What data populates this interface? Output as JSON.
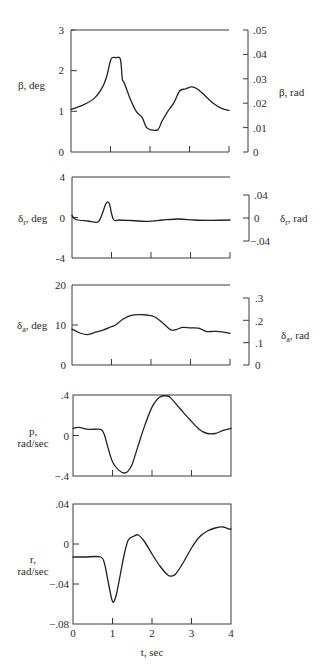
{
  "chart_data": [
    {
      "type": "line",
      "id": "beta",
      "ylabel": "β, deg",
      "ylabel_right": "β, rad",
      "xlim": [
        0,
        4
      ],
      "ylim": [
        0,
        3
      ],
      "yticks": [
        0,
        1,
        2,
        3
      ],
      "ytick_labels": [
        "0",
        "1",
        "2",
        "3"
      ],
      "right_ylim": [
        0,
        0.05
      ],
      "right_yticks": [
        0,
        0.01,
        0.02,
        0.03,
        0.04,
        0.05
      ],
      "right_ytick_labels": [
        "0",
        ".01",
        ".02",
        ".03",
        ".04",
        ".05"
      ],
      "xticks": [
        1,
        2,
        3,
        4
      ],
      "grid": false,
      "x": [
        0,
        0.3,
        0.6,
        0.8,
        0.9,
        1.0,
        1.05,
        1.15,
        1.25,
        1.3,
        1.35,
        1.5,
        1.65,
        1.8,
        1.9,
        2.0,
        2.2,
        2.3,
        2.45,
        2.6,
        2.75,
        2.9,
        3.05,
        3.2,
        3.4,
        3.6,
        3.8,
        4.0
      ],
      "values": [
        1.05,
        1.15,
        1.33,
        1.6,
        1.85,
        2.25,
        2.32,
        2.32,
        2.28,
        1.8,
        1.7,
        1.3,
        1.0,
        0.85,
        0.62,
        0.55,
        0.55,
        0.75,
        1.0,
        1.2,
        1.5,
        1.55,
        1.6,
        1.55,
        1.38,
        1.2,
        1.08,
        1.02
      ]
    },
    {
      "type": "line",
      "id": "delta_r",
      "ylabel": "δr, deg",
      "ylabel_right": "δr, rad",
      "xlim": [
        0,
        4
      ],
      "ylim": [
        -4,
        4
      ],
      "yticks": [
        -4,
        0,
        4
      ],
      "ytick_labels": [
        "-4",
        "0",
        "4"
      ],
      "right_ylim": [
        -0.04,
        0.04
      ],
      "right_yticks": [
        -0.04,
        0,
        0.04
      ],
      "right_ytick_labels": [
        "-.04",
        "0",
        ".04"
      ],
      "xticks": [
        1,
        2,
        3,
        4
      ],
      "grid": false,
      "x": [
        0,
        0.1,
        0.4,
        0.65,
        0.75,
        0.85,
        0.9,
        0.95,
        1.05,
        1.2,
        1.5,
        1.9,
        2.3,
        2.7,
        3.1,
        3.5,
        4.0
      ],
      "values": [
        0.2,
        -0.2,
        -0.35,
        -0.45,
        0.2,
        1.3,
        1.55,
        1.3,
        -0.2,
        -0.25,
        -0.3,
        -0.38,
        -0.25,
        -0.15,
        -0.25,
        -0.28,
        -0.25
      ]
    },
    {
      "type": "line",
      "id": "delta_a",
      "ylabel": "δa, deg",
      "ylabel_right": "δa, rad",
      "xlim": [
        0,
        4
      ],
      "ylim": [
        0,
        20
      ],
      "yticks": [
        0,
        10,
        20
      ],
      "ytick_labels": [
        "0",
        "10",
        "20"
      ],
      "right_ylim": [
        0,
        0.3
      ],
      "right_yticks": [
        0,
        0.1,
        0.2,
        0.3
      ],
      "right_ytick_labels": [
        "0",
        ".1",
        ".2",
        ".3"
      ],
      "xticks": [
        1,
        2,
        3,
        4
      ],
      "grid": false,
      "x": [
        0,
        0.2,
        0.4,
        0.6,
        0.8,
        1.0,
        1.1,
        1.3,
        1.5,
        1.7,
        1.9,
        2.1,
        2.3,
        2.5,
        2.65,
        2.8,
        3.0,
        3.2,
        3.4,
        3.6,
        3.8,
        4.0
      ],
      "values": [
        9.0,
        8.0,
        7.6,
        8.2,
        8.8,
        9.6,
        10.0,
        11.5,
        12.4,
        12.6,
        12.5,
        12.0,
        10.5,
        8.8,
        8.9,
        9.4,
        9.3,
        9.2,
        8.4,
        8.4,
        8.3,
        7.9
      ]
    },
    {
      "type": "line",
      "id": "p",
      "ylabel": "p, rad/sec",
      "xlim": [
        0,
        4
      ],
      "ylim": [
        -0.4,
        0.4
      ],
      "yticks": [
        -0.4,
        0,
        0.4
      ],
      "ytick_labels": [
        "-.4",
        "0",
        ".4"
      ],
      "xticks": [
        1,
        2,
        3,
        4
      ],
      "grid": false,
      "x": [
        0,
        0.15,
        0.4,
        0.7,
        0.8,
        0.9,
        1.0,
        1.15,
        1.3,
        1.4,
        1.5,
        1.65,
        1.8,
        2.0,
        2.2,
        2.4,
        2.5,
        2.7,
        2.95,
        3.2,
        3.4,
        3.6,
        3.8,
        4.0
      ],
      "values": [
        0.07,
        0.08,
        0.06,
        0.06,
        0.0,
        -0.14,
        -0.26,
        -0.34,
        -0.37,
        -0.35,
        -0.28,
        -0.1,
        0.08,
        0.28,
        0.38,
        0.39,
        0.36,
        0.27,
        0.16,
        0.06,
        0.02,
        0.02,
        0.05,
        0.07
      ]
    },
    {
      "type": "line",
      "id": "r",
      "ylabel": "r, rad/sec",
      "xlabel": "t, sec",
      "xlim": [
        0,
        4
      ],
      "ylim": [
        -0.08,
        0.04
      ],
      "yticks": [
        -0.08,
        -0.04,
        0,
        0.04
      ],
      "ytick_labels": [
        "-.08",
        "-.04",
        "0",
        ".04"
      ],
      "xticks": [
        0,
        1,
        2,
        3,
        4
      ],
      "xtick_labels": [
        "0",
        "1",
        "2",
        "3",
        "4"
      ],
      "grid": false,
      "x": [
        0,
        0.3,
        0.7,
        0.8,
        0.9,
        0.98,
        1.03,
        1.1,
        1.2,
        1.3,
        1.4,
        1.55,
        1.65,
        1.8,
        2.0,
        2.2,
        2.4,
        2.5,
        2.6,
        2.8,
        3.0,
        3.2,
        3.4,
        3.6,
        3.8,
        3.95,
        4.0
      ],
      "values": [
        -0.013,
        -0.013,
        -0.013,
        -0.02,
        -0.04,
        -0.055,
        -0.058,
        -0.05,
        -0.03,
        -0.01,
        0.004,
        0.008,
        0.009,
        0.003,
        -0.01,
        -0.022,
        -0.031,
        -0.032,
        -0.03,
        -0.018,
        -0.004,
        0.007,
        0.013,
        0.016,
        0.017,
        0.015,
        0.015
      ]
    }
  ],
  "panels": {
    "beta": {
      "ylabel": "β, deg",
      "ylabel_right": "β, rad",
      "ticks_left": [
        "0",
        "1",
        "2",
        "3"
      ],
      "ticks_right": [
        "0",
        ".01",
        ".02",
        ".03",
        ".04",
        ".05"
      ]
    },
    "delta_r": {
      "ylabel_symbol": "δ",
      "ylabel_sub": "r",
      "ylabel_unit": ", deg",
      "ylabel_right_unit": ", rad",
      "ticks_left": [
        "-4",
        "0",
        "4"
      ],
      "ticks_right": [
        "−.04",
        "0",
        ".04"
      ]
    },
    "delta_a": {
      "ylabel_symbol": "δ",
      "ylabel_sub": "a",
      "ylabel_unit": ", deg",
      "ylabel_right_unit": ", rad",
      "ticks_left": [
        "0",
        "10",
        "20"
      ],
      "ticks_right": [
        "0",
        ".1",
        ".2",
        ".3"
      ]
    },
    "p": {
      "ylabel_line1": "p,",
      "ylabel_line2": "rad/sec",
      "ticks_left": [
        "−.4",
        "0",
        ".4"
      ]
    },
    "r": {
      "ylabel_line1": "r,",
      "ylabel_line2": "rad/sec",
      "ticks_left": [
        "−.08",
        "−.04",
        "0",
        ".04"
      ],
      "ticks_x": [
        "0",
        "1",
        "2",
        "3",
        "4"
      ],
      "xlabel": "t, sec"
    }
  }
}
